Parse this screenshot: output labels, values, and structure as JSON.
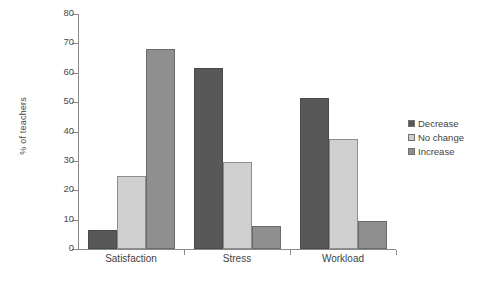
{
  "chart_data": {
    "type": "bar",
    "title": "",
    "subtitle": "",
    "xlabel": "",
    "ylabel": "% of teachers",
    "categories": [
      "Satisfaction",
      "Stress",
      "Workload"
    ],
    "series": [
      {
        "name": "Decrease",
        "color": "#585858",
        "values": [
          6.5,
          61.5,
          51.5
        ]
      },
      {
        "name": "No change",
        "color": "#d0d0d0",
        "values": [
          25.0,
          29.5,
          37.5
        ]
      },
      {
        "name": "Increase",
        "color": "#8f8f8f",
        "values": [
          68.0,
          8.0,
          9.5
        ]
      }
    ],
    "ylim": [
      0,
      80
    ],
    "yticks": [
      0,
      10,
      20,
      30,
      40,
      50,
      60,
      70,
      80
    ],
    "ytick_labels": [
      "0",
      "10",
      "20",
      "30",
      "40",
      "50",
      "60",
      "70",
      "80"
    ],
    "grid": false,
    "legend_position": "right",
    "annotations": []
  },
  "legend": {
    "entries": [
      {
        "label": "Decrease",
        "color": "#585858"
      },
      {
        "label": "No change",
        "color": "#d0d0d0"
      },
      {
        "label": "Increase",
        "color": "#8f8f8f"
      }
    ]
  }
}
